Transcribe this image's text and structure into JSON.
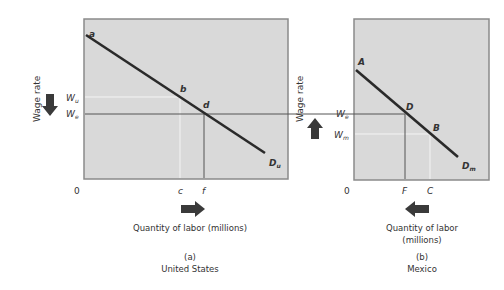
{
  "panels": [
    {
      "id": "a",
      "caption_letter": "(a)",
      "caption_country": "United States",
      "y_axis_label": "Wage rate",
      "x_axis_label": "Quantity of labor (millions)",
      "origin": "0",
      "curve_label": "D",
      "curve_sub": "u",
      "points": {
        "start": "a",
        "mid1": "b",
        "mid2": "d"
      },
      "wage_ticks": [
        {
          "main": "W",
          "sub": "u"
        },
        {
          "main": "W",
          "sub": "e"
        }
      ],
      "qty_ticks": [
        "c",
        "f"
      ],
      "wage_arrow": "down",
      "qty_arrow": "right"
    },
    {
      "id": "b",
      "caption_letter": "(b)",
      "caption_country": "Mexico",
      "y_axis_label": "Wage rate",
      "x_axis_label_line1": "Quantity of labor",
      "x_axis_label_line2": "(millions)",
      "origin": "0",
      "curve_label": "D",
      "curve_sub": "m",
      "points": {
        "start": "A",
        "mid1": "D",
        "mid2": "B"
      },
      "wage_ticks": [
        {
          "main": "W",
          "sub": "e"
        },
        {
          "main": "W",
          "sub": "m"
        }
      ],
      "qty_ticks": [
        "F",
        "C"
      ],
      "wage_arrow": "up",
      "qty_arrow": "left"
    }
  ],
  "colors": {
    "panel_fill": "#d9d9d9",
    "panel_border": "#8a8a8a",
    "curve": "#2a2a2a",
    "arrow": "#3a3a3a",
    "guide_white": "#f4f4f4",
    "guide_dark": "#555555"
  }
}
